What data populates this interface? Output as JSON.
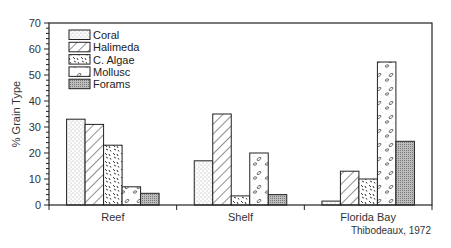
{
  "chart_data": {
    "type": "bar",
    "title": "",
    "xlabel": "",
    "ylabel": "% Grain Type",
    "ylim": [
      0,
      70
    ],
    "yticks": [
      0,
      10,
      20,
      30,
      40,
      50,
      60,
      70
    ],
    "grid": false,
    "legend_position": "upper-left (inside)",
    "categories": [
      "Reef",
      "Shelf",
      "Florida Bay"
    ],
    "series": [
      {
        "name": "Coral",
        "pattern": "stipple",
        "values": [
          33,
          17,
          1.5
        ]
      },
      {
        "name": "Halimeda",
        "pattern": "diagonal-hatch",
        "values": [
          31,
          35,
          13
        ]
      },
      {
        "name": "C. Algae",
        "pattern": "speckle",
        "values": [
          23,
          3.5,
          10
        ]
      },
      {
        "name": "Mollusc",
        "pattern": "shell-ovals",
        "values": [
          7,
          20,
          55
        ]
      },
      {
        "name": "Forams",
        "pattern": "dense-dots",
        "values": [
          4.5,
          4,
          24.5
        ]
      }
    ],
    "annotation": "Thibodeaux, 1972"
  },
  "labels": {
    "ylabel": "% Grain Type",
    "credit": "Thibodeaux, 1972"
  }
}
